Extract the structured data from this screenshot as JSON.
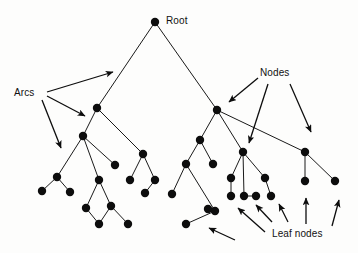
{
  "diagram": {
    "background_color": "#fdfdfc",
    "node_color": "#0d0d0d",
    "arc_color": "#1a1a1a",
    "labels": {
      "root": "Root",
      "arcs": "Arcs",
      "nodes": "Nodes",
      "leaf_nodes": "Leaf nodes"
    },
    "node_radius": 4.2,
    "node_count": 36,
    "nodes": [
      {
        "id": "root",
        "x": 155,
        "y": 22,
        "level": 0
      },
      {
        "id": "L1",
        "x": 97,
        "y": 108,
        "level": 1
      },
      {
        "id": "R1",
        "x": 217,
        "y": 110,
        "level": 1
      },
      {
        "id": "L2a",
        "x": 83,
        "y": 136,
        "level": 2
      },
      {
        "id": "L2b",
        "x": 143,
        "y": 154,
        "level": 2
      },
      {
        "id": "L3a",
        "x": 57,
        "y": 177,
        "level": 3
      },
      {
        "id": "L3b",
        "x": 99,
        "y": 180,
        "level": 3
      },
      {
        "id": "L3c",
        "x": 115,
        "y": 165,
        "level": 3
      },
      {
        "id": "L3d",
        "x": 130,
        "y": 180,
        "level": 3
      },
      {
        "id": "L3e",
        "x": 155,
        "y": 180,
        "level": 3
      },
      {
        "id": "L4a",
        "x": 42,
        "y": 191,
        "level": 4
      },
      {
        "id": "L4b",
        "x": 70,
        "y": 192,
        "level": 4
      },
      {
        "id": "L4c",
        "x": 86,
        "y": 208,
        "level": 4
      },
      {
        "id": "L4d",
        "x": 111,
        "y": 206,
        "level": 4
      },
      {
        "id": "L4e",
        "x": 145,
        "y": 193,
        "level": 4
      },
      {
        "id": "L5a",
        "x": 99,
        "y": 224,
        "level": 5
      },
      {
        "id": "L5b",
        "x": 128,
        "y": 224,
        "level": 5
      },
      {
        "id": "R2a",
        "x": 200,
        "y": 140,
        "level": 2
      },
      {
        "id": "R2b",
        "x": 243,
        "y": 152,
        "level": 2
      },
      {
        "id": "R2c",
        "x": 305,
        "y": 152,
        "level": 2
      },
      {
        "id": "R3a",
        "x": 186,
        "y": 164,
        "level": 3
      },
      {
        "id": "R3b",
        "x": 213,
        "y": 164,
        "level": 3
      },
      {
        "id": "R3c",
        "x": 231,
        "y": 178,
        "level": 3
      },
      {
        "id": "R3d",
        "x": 265,
        "y": 178,
        "level": 3
      },
      {
        "id": "R3e",
        "x": 305,
        "y": 181,
        "level": 3
      },
      {
        "id": "R3f",
        "x": 335,
        "y": 181,
        "level": 3
      },
      {
        "id": "R4a",
        "x": 172,
        "y": 194,
        "level": 4
      },
      {
        "id": "R4b",
        "x": 231,
        "y": 196,
        "level": 4
      },
      {
        "id": "R4c",
        "x": 244,
        "y": 196,
        "level": 4
      },
      {
        "id": "R4d",
        "x": 256,
        "y": 196,
        "level": 4
      },
      {
        "id": "R4e",
        "x": 271,
        "y": 196,
        "level": 4
      },
      {
        "id": "R4f",
        "x": 208,
        "y": 209,
        "level": 4
      },
      {
        "id": "R4g",
        "x": 215,
        "y": 211,
        "level": 4
      },
      {
        "id": "R5a",
        "x": 186,
        "y": 224,
        "level": 5
      }
    ],
    "arcs": [
      {
        "from": "root",
        "to": "L1"
      },
      {
        "from": "root",
        "to": "R1"
      },
      {
        "from": "L1",
        "to": "L2a"
      },
      {
        "from": "L1",
        "to": "L2b"
      },
      {
        "from": "L2a",
        "to": "L3a"
      },
      {
        "from": "L2a",
        "to": "L3b"
      },
      {
        "from": "L2a",
        "to": "L3c"
      },
      {
        "from": "L2b",
        "to": "L3d"
      },
      {
        "from": "L2b",
        "to": "L3e"
      },
      {
        "from": "L3a",
        "to": "L4a"
      },
      {
        "from": "L3a",
        "to": "L4b"
      },
      {
        "from": "L3b",
        "to": "L4c"
      },
      {
        "from": "L3b",
        "to": "L4d"
      },
      {
        "from": "L4c",
        "to": "L5a"
      },
      {
        "from": "L4d",
        "to": "L5a"
      },
      {
        "from": "L4d",
        "to": "L5b"
      },
      {
        "from": "L3e",
        "to": "L4e"
      },
      {
        "from": "R1",
        "to": "R2a"
      },
      {
        "from": "R1",
        "to": "R2b"
      },
      {
        "from": "R1",
        "to": "R2c"
      },
      {
        "from": "R2a",
        "to": "R3a"
      },
      {
        "from": "R2a",
        "to": "R3b"
      },
      {
        "from": "R2b",
        "to": "R3c"
      },
      {
        "from": "R2b",
        "to": "R4c"
      },
      {
        "from": "R2b",
        "to": "R3d"
      },
      {
        "from": "R2c",
        "to": "R3e"
      },
      {
        "from": "R2c",
        "to": "R3f"
      },
      {
        "from": "R3a",
        "to": "R4a"
      },
      {
        "from": "R3a",
        "to": "R4g"
      },
      {
        "from": "R3c",
        "to": "R4b"
      },
      {
        "from": "R3d",
        "to": "R4e"
      },
      {
        "from": "R4c",
        "to": "R4d"
      },
      {
        "from": "R4g",
        "to": "R5a"
      },
      {
        "from": "R4g",
        "to": "R4f"
      }
    ],
    "annotations": [
      {
        "name": "arcs-annotation",
        "label": "Arcs",
        "label_x": 14,
        "label_y": 88,
        "arrows": [
          {
            "x1": 47,
            "y1": 92,
            "x2": 113,
            "y2": 72
          },
          {
            "x1": 47,
            "y1": 96,
            "x2": 85,
            "y2": 116
          },
          {
            "x1": 42,
            "y1": 100,
            "x2": 61,
            "y2": 148
          }
        ]
      },
      {
        "name": "nodes-annotation",
        "label": "Nodes",
        "label_x": 260,
        "label_y": 68,
        "arrows": [
          {
            "x1": 258,
            "y1": 78,
            "x2": 229,
            "y2": 102
          },
          {
            "x1": 268,
            "y1": 84,
            "x2": 249,
            "y2": 143
          },
          {
            "x1": 290,
            "y1": 84,
            "x2": 311,
            "y2": 132
          }
        ]
      },
      {
        "name": "leaf-nodes-annotation",
        "label": "Leaf nodes",
        "label_x": 272,
        "label_y": 229,
        "arrows": [
          {
            "x1": 235,
            "y1": 240,
            "x2": 209,
            "y2": 228
          },
          {
            "x1": 265,
            "y1": 232,
            "x2": 238,
            "y2": 208
          },
          {
            "x1": 272,
            "y1": 222,
            "x2": 256,
            "y2": 205
          },
          {
            "x1": 288,
            "y1": 222,
            "x2": 279,
            "y2": 204
          },
          {
            "x1": 306,
            "y1": 224,
            "x2": 306,
            "y2": 198
          },
          {
            "x1": 332,
            "y1": 226,
            "x2": 339,
            "y2": 200
          }
        ]
      }
    ]
  }
}
